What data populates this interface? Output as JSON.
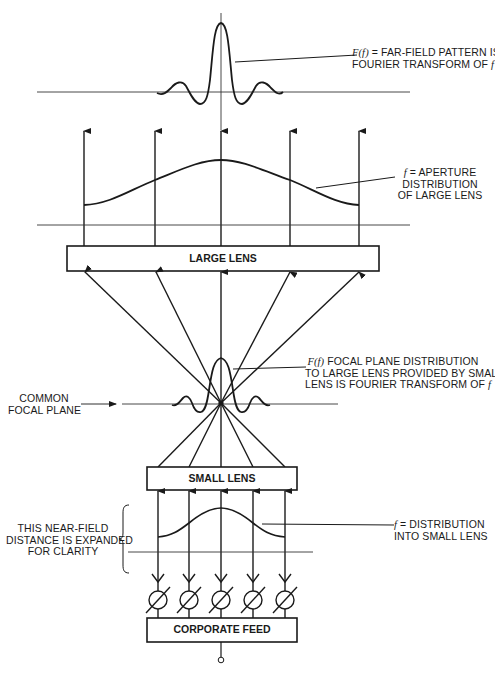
{
  "diagram": {
    "labels": {
      "far_field": {
        "line1_prefix": "F(f)",
        "line1_rest": " = FAR-FIELD PATTERN IS",
        "line2": "FOURIER TRANSFORM OF ",
        "line2_symbol": "f"
      },
      "aperture": {
        "line1_symbol": "f",
        "line1_rest": " = APERTURE",
        "line2": "DISTRIBUTION",
        "line3": "OF LARGE LENS"
      },
      "focal_distribution": {
        "line1_prefix": "F(f)",
        "line1_rest": " FOCAL PLANE DISTRIBUTION",
        "line2": "TO LARGE LENS PROVIDED BY SMALL",
        "line3": "LENS IS FOURIER TRANSFORM OF ",
        "line3_symbol": "f"
      },
      "common_focal_plane": {
        "line1": "COMMON",
        "line2": "FOCAL PLANE"
      },
      "near_field": {
        "line1": "THIS NEAR-FIELD",
        "line2": "DISTANCE IS EXPANDED",
        "line3": "FOR CLARITY"
      },
      "small_distribution": {
        "line1_symbol": "f",
        "line1_rest": " = DISTRIBUTION",
        "line2": "INTO SMALL LENS"
      }
    },
    "blocks": {
      "large_lens": "LARGE LENS",
      "small_lens": "SMALL LENS",
      "corporate_feed": "CORPORATE FEED"
    },
    "element_count": 5,
    "phase_shifter_count": 5,
    "colors": {
      "ink": "#1a1a1a",
      "paper": "#ffffff"
    }
  }
}
